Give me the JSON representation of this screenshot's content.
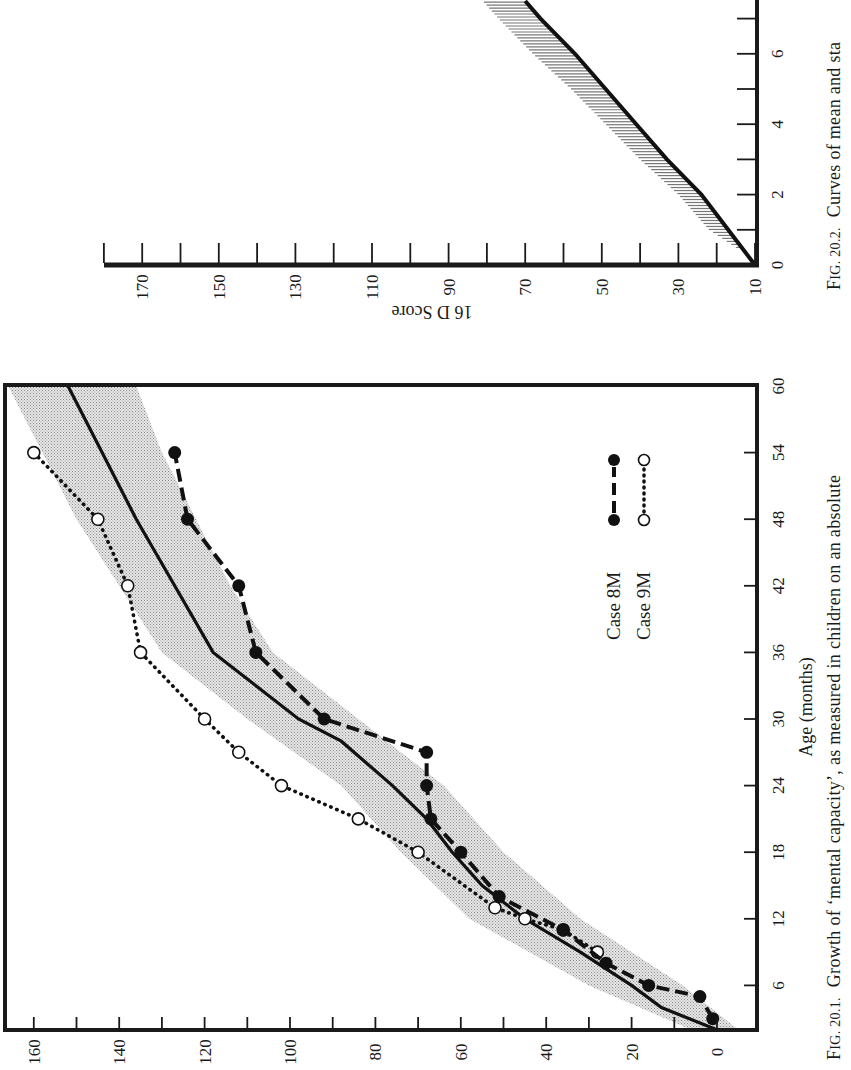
{
  "page": {
    "orientation": "rotated 90 degrees counter-clockwise (book page scan)"
  },
  "figure1": {
    "caption": "Fig. 20.1.  Growth of ‘mental capacity’, as measured in children on an absolute",
    "caption_prefix": "F",
    "caption_smallcaps": "IG. 20.1.",
    "caption_body": "Growth of ‘mental capacity’, as measured in children on an absolute",
    "xlabel": "Age (months)",
    "legend": [
      {
        "label": "Case 8M",
        "style": "dashed line, filled circles"
      },
      {
        "label": "Case 9M",
        "style": "dotted line, open circles"
      }
    ]
  },
  "figure2": {
    "caption": "Fig. 20.2.  Curves of mean and sta",
    "caption_prefix": "F",
    "caption_smallcaps": "IG. 20.2.",
    "caption_body": "Curves of mean and sta",
    "ylabel": "16 D Score"
  },
  "chart_data": [
    {
      "type": "line",
      "title": "Fig. 20.1. Growth of ‘mental capacity’, as measured in children on an absolute",
      "xlabel": "Age (months)",
      "ylabel": "",
      "xlim": [
        2,
        60
      ],
      "ylim": [
        -5,
        165
      ],
      "x_ticks": [
        6,
        12,
        18,
        24,
        30,
        36,
        42,
        48,
        54,
        60
      ],
      "y_ticks": [
        0,
        20,
        40,
        60,
        80,
        100,
        120,
        140,
        160
      ],
      "y_minor_ticks": [
        10,
        30,
        50,
        70,
        90,
        110,
        130,
        150
      ],
      "grid": false,
      "legend_position": "inside, lower-right region of plot (upper-right in rotated view)",
      "series": [
        {
          "name": "Mean",
          "style": "solid",
          "x": [
            2,
            4,
            6,
            9,
            12,
            15,
            18,
            21,
            24,
            28,
            30,
            36,
            42,
            48,
            54,
            60
          ],
          "y": [
            0,
            13,
            20,
            32,
            45,
            55,
            62,
            68,
            76,
            88,
            98,
            118,
            127,
            136,
            144,
            152
          ]
        },
        {
          "name": "Standard deviation band",
          "style": "shaded area (stippled grey)",
          "x": [
            2,
            6,
            12,
            18,
            24,
            30,
            36,
            42,
            48,
            54,
            60
          ],
          "lower": [
            -5,
            8,
            32,
            50,
            64,
            84,
            104,
            114,
            122,
            130,
            136
          ],
          "upper": [
            6,
            30,
            58,
            74,
            88,
            110,
            130,
            140,
            150,
            158,
            166
          ]
        },
        {
          "name": "Case 8M",
          "style": "dashed, filled circles",
          "x": [
            3,
            5,
            6,
            8,
            11,
            14,
            18,
            21,
            24,
            27,
            30,
            36,
            42,
            48,
            54
          ],
          "y": [
            1,
            4,
            16,
            26,
            36,
            51,
            60,
            67,
            68,
            68,
            92,
            108,
            112,
            124,
            127
          ]
        },
        {
          "name": "Case 9M",
          "style": "dotted, open circles",
          "x": [
            9,
            11,
            12,
            13,
            18,
            21,
            24,
            27,
            30,
            36,
            42,
            48,
            54
          ],
          "y": [
            28,
            36,
            45,
            52,
            70,
            84,
            102,
            112,
            120,
            135,
            138,
            145,
            160
          ]
        }
      ]
    },
    {
      "type": "line",
      "title": "Fig. 20.2. Curves of mean and sta (truncated)",
      "xlabel": "",
      "ylabel": "16 D Score",
      "xlim": [
        0,
        7.5
      ],
      "ylim": [
        10,
        180
      ],
      "x_ticks": [
        0,
        2,
        4,
        6
      ],
      "x_minor_ticks": [
        1,
        3,
        5,
        7
      ],
      "y_ticks": [
        10,
        30,
        50,
        70,
        90,
        110,
        130,
        150,
        170
      ],
      "y_minor_ticks": [
        20,
        40,
        60,
        80,
        100,
        120,
        140,
        160,
        180
      ],
      "grid": false,
      "series": [
        {
          "name": "Mean",
          "style": "solid thick",
          "x": [
            0,
            1,
            2,
            3,
            4,
            5,
            6,
            7,
            7.5
          ],
          "y": [
            10,
            17,
            24,
            33,
            41,
            49,
            57,
            66,
            70
          ]
        },
        {
          "name": "Standard deviation band",
          "style": "horizontal hatching",
          "x": [
            0.5,
            1,
            2,
            3,
            4,
            5,
            6,
            7,
            7.5
          ],
          "upper": [
            12,
            19,
            27,
            37,
            46,
            55,
            65,
            74,
            78
          ]
        }
      ]
    }
  ]
}
